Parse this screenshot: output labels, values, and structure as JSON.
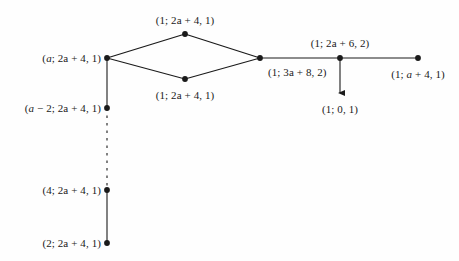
{
  "figure": {
    "background_color": "#fefefe",
    "ink_color": "#1a1a1a",
    "width": 459,
    "height": 261
  },
  "labels": {
    "top_diamond": "(1; 2a + 4, 1)",
    "left_apex": "(a; 2a + 4, 1)",
    "bottom_diamond": "(1; 2a + 4, 1)",
    "right_apex": "(1; 3a + 8, 2)",
    "upper_right": "(1; 2a + 6, 2)",
    "far_right": "(1; a + 4, 1)",
    "arrow_target": "(1; 0, 1)",
    "chain_second": "(a − 2; 2a + 4, 1)",
    "chain_third": "(4; 2a + 4, 1)",
    "chain_fourth": "(2; 2a + 4, 1)"
  },
  "nodes": [
    {
      "name": "left-apex",
      "x": 107,
      "y": 58
    },
    {
      "name": "top-diamond",
      "x": 185,
      "y": 34
    },
    {
      "name": "bottom-diamond",
      "x": 185,
      "y": 79
    },
    {
      "name": "right-apex",
      "x": 260,
      "y": 58
    },
    {
      "name": "upper-right",
      "x": 340,
      "y": 58
    },
    {
      "name": "far-right",
      "x": 418,
      "y": 58
    },
    {
      "name": "chain-second",
      "x": 107,
      "y": 108
    },
    {
      "name": "chain-third",
      "x": 107,
      "y": 190
    },
    {
      "name": "chain-fourth",
      "x": 107,
      "y": 243
    }
  ],
  "label_positions": {
    "top_diamond": {
      "x": 185,
      "y": 20,
      "align": "center"
    },
    "left_apex": {
      "x": 101,
      "y": 58,
      "align": "right"
    },
    "bottom_diamond": {
      "x": 185,
      "y": 95,
      "align": "center"
    },
    "right_apex": {
      "x": 268,
      "y": 72,
      "align": "left"
    },
    "upper_right": {
      "x": 340,
      "y": 43,
      "align": "center"
    },
    "far_right": {
      "x": 418,
      "y": 74,
      "align": "center"
    },
    "arrow_target": {
      "x": 340,
      "y": 109,
      "align": "center"
    },
    "chain_second": {
      "x": 101,
      "y": 108,
      "align": "right"
    },
    "chain_third": {
      "x": 101,
      "y": 190,
      "align": "right"
    },
    "chain_fourth": {
      "x": 101,
      "y": 243,
      "align": "right"
    }
  },
  "edges": [
    {
      "name": "left-to-top",
      "x1": 107,
      "y1": 58,
      "x2": 185,
      "y2": 34,
      "style": "solid"
    },
    {
      "name": "top-to-right",
      "x1": 185,
      "y1": 34,
      "x2": 260,
      "y2": 58,
      "style": "solid"
    },
    {
      "name": "left-to-bottom",
      "x1": 107,
      "y1": 58,
      "x2": 185,
      "y2": 79,
      "style": "solid"
    },
    {
      "name": "bottom-to-right",
      "x1": 185,
      "y1": 79,
      "x2": 260,
      "y2": 58,
      "style": "solid"
    },
    {
      "name": "right-to-upperright",
      "x1": 260,
      "y1": 58,
      "x2": 340,
      "y2": 58,
      "style": "solid"
    },
    {
      "name": "upperright-to-far",
      "x1": 340,
      "y1": 58,
      "x2": 418,
      "y2": 58,
      "style": "solid"
    },
    {
      "name": "chain-top-segment",
      "x1": 107,
      "y1": 58,
      "x2": 107,
      "y2": 108,
      "style": "solid"
    },
    {
      "name": "chain-dashed",
      "x1": 107,
      "y1": 108,
      "x2": 107,
      "y2": 190,
      "style": "dashed"
    },
    {
      "name": "chain-bottom",
      "x1": 107,
      "y1": 190,
      "x2": 107,
      "y2": 243,
      "style": "solid"
    }
  ],
  "arrows": [
    {
      "name": "down-arrow",
      "x1": 340,
      "y1": 58,
      "x2": 340,
      "y2": 93
    }
  ]
}
